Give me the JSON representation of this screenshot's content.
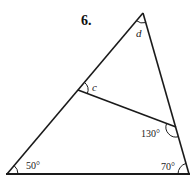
{
  "problem_number": "6.",
  "labels": {
    "apex_angle": "d",
    "inner_angle": "c",
    "right_inner_angle": "130°",
    "bottom_left_angle": "50°",
    "bottom_right_angle": "70°"
  },
  "colors": {
    "stroke": "#1a1a1a",
    "background": "#ffffff"
  },
  "geometry": {
    "apex": [
      143,
      13
    ],
    "bottom_left": [
      7,
      174
    ],
    "bottom_right": [
      189,
      174
    ],
    "segment_left": [
      78,
      90
    ],
    "segment_right": [
      176,
      127
    ]
  }
}
